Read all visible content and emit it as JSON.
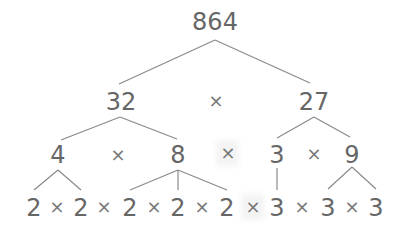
{
  "diagram": {
    "line_color": "#8a8a8a",
    "text_color": "#666666",
    "times_symbol": "×",
    "nodes": [
      {
        "id": "n864",
        "label": "864",
        "x": 215,
        "y": 22
      },
      {
        "id": "n32",
        "label": "32",
        "x": 121,
        "y": 102
      },
      {
        "id": "n27",
        "label": "27",
        "x": 314,
        "y": 102
      },
      {
        "id": "n4",
        "label": "4",
        "x": 58,
        "y": 155
      },
      {
        "id": "n8",
        "label": "8",
        "x": 178,
        "y": 155
      },
      {
        "id": "n3a",
        "label": "3",
        "x": 277,
        "y": 155
      },
      {
        "id": "n9",
        "label": "9",
        "x": 352,
        "y": 155
      },
      {
        "id": "l1",
        "label": "2",
        "x": 34,
        "y": 208
      },
      {
        "id": "l2",
        "label": "2",
        "x": 81,
        "y": 208
      },
      {
        "id": "l3",
        "label": "2",
        "x": 130,
        "y": 208
      },
      {
        "id": "l4",
        "label": "2",
        "x": 178,
        "y": 208
      },
      {
        "id": "l5",
        "label": "2",
        "x": 227,
        "y": 208
      },
      {
        "id": "l6",
        "label": "3",
        "x": 277,
        "y": 208
      },
      {
        "id": "l7",
        "label": "3",
        "x": 328,
        "y": 208
      },
      {
        "id": "l8",
        "label": "3",
        "x": 376,
        "y": 208
      }
    ],
    "operators": [
      {
        "x": 216,
        "y": 101,
        "glow": false
      },
      {
        "x": 118,
        "y": 155,
        "glow": false
      },
      {
        "x": 228,
        "y": 153,
        "glow": true
      },
      {
        "x": 314,
        "y": 154,
        "glow": false
      },
      {
        "x": 57,
        "y": 207,
        "glow": false
      },
      {
        "x": 104,
        "y": 207,
        "glow": false
      },
      {
        "x": 154,
        "y": 207,
        "glow": false
      },
      {
        "x": 202,
        "y": 207,
        "glow": false
      },
      {
        "x": 253,
        "y": 207,
        "glow": true
      },
      {
        "x": 302,
        "y": 207,
        "glow": false
      },
      {
        "x": 352,
        "y": 207,
        "glow": false
      }
    ],
    "edges": [
      {
        "from": [
          215,
          40
        ],
        "to": [
          119,
          84
        ]
      },
      {
        "from": [
          215,
          40
        ],
        "to": [
          310,
          83
        ]
      },
      {
        "from": [
          120,
          117
        ],
        "to": [
          61,
          140
        ]
      },
      {
        "from": [
          120,
          117
        ],
        "to": [
          177,
          139
        ]
      },
      {
        "from": [
          314,
          117
        ],
        "to": [
          277,
          138
        ]
      },
      {
        "from": [
          314,
          117
        ],
        "to": [
          350,
          137
        ]
      },
      {
        "from": [
          58,
          170
        ],
        "to": [
          34,
          190
        ]
      },
      {
        "from": [
          58,
          170
        ],
        "to": [
          81,
          190
        ]
      },
      {
        "from": [
          178,
          170
        ],
        "to": [
          130,
          190
        ]
      },
      {
        "from": [
          178,
          170
        ],
        "to": [
          178,
          190
        ]
      },
      {
        "from": [
          178,
          170
        ],
        "to": [
          227,
          190
        ]
      },
      {
        "from": [
          277,
          168
        ],
        "to": [
          277,
          190
        ]
      },
      {
        "from": [
          352,
          167
        ],
        "to": [
          328,
          189
        ]
      },
      {
        "from": [
          352,
          167
        ],
        "to": [
          376,
          189
        ]
      }
    ],
    "equation_rows": {
      "row1": "32 × 27",
      "row2": "4 × 8 × 3 × 9",
      "row3": "2 × 2 × 2 × 2 × 2 × 3 × 3 × 3"
    }
  }
}
